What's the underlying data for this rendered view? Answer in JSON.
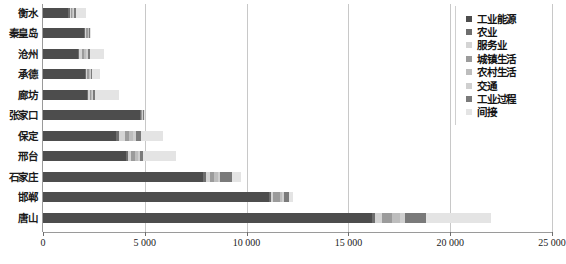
{
  "chart_data": {
    "type": "bar",
    "orientation": "horizontal",
    "stacked": true,
    "title": "",
    "subtitle": "",
    "xlabel": "",
    "ylabel": "",
    "xlim": [
      0,
      25000
    ],
    "ylim": null,
    "grid": true,
    "grid_axis": "x",
    "legend_position": "right",
    "xtick_labels": [
      "0",
      "5 000",
      "10 000",
      "15 000",
      "20 000",
      "25 000"
    ],
    "xtick_values": [
      0,
      5000,
      10000,
      15000,
      20000,
      25000
    ],
    "categories": [
      "衡水",
      "秦皇岛",
      "沧州",
      "承德",
      "廊坊",
      "张家口",
      "保定",
      "邢台",
      "石家庄",
      "邯郸",
      "唐山"
    ],
    "series": [
      {
        "name": "工业能源",
        "color": "#4d4d4d",
        "values": [
          1250,
          2030,
          1720,
          2080,
          2180,
          4760,
          3580,
          4100,
          7860,
          11100,
          16150
        ]
      },
      {
        "name": "农业",
        "color": "#6e6e6e",
        "values": [
          60,
          45,
          60,
          40,
          55,
          40,
          160,
          95,
          130,
          80,
          180
        ]
      },
      {
        "name": "服务业",
        "color": "#d4d4d4",
        "values": [
          70,
          40,
          140,
          35,
          55,
          20,
          280,
          150,
          200,
          120,
          300
        ]
      },
      {
        "name": "城镇生活",
        "color": "#9b9b9b",
        "values": [
          55,
          95,
          85,
          110,
          75,
          45,
          220,
          170,
          230,
          330,
          520
        ]
      },
      {
        "name": "农村生活",
        "color": "#bdbdbd",
        "values": [
          55,
          30,
          110,
          45,
          60,
          20,
          190,
          130,
          160,
          120,
          380
        ]
      },
      {
        "name": "交通",
        "color": "#cfcfcf",
        "values": [
          50,
          30,
          95,
          40,
          50,
          25,
          150,
          110,
          140,
          100,
          260
        ]
      },
      {
        "name": "工业过程",
        "color": "#7a7a7a",
        "values": [
          70,
          45,
          120,
          55,
          70,
          30,
          230,
          180,
          560,
          240,
          1030
        ]
      },
      {
        "name": "间接",
        "color": "#e4e4e4",
        "values": [
          500,
          45,
          690,
          375,
          1180,
          15,
          1090,
          1580,
          430,
          210,
          3210
        ]
      }
    ]
  },
  "legend": {
    "items": [
      {
        "label": "工业能源",
        "color": "#4d4d4d"
      },
      {
        "label": "农业",
        "color": "#6e6e6e"
      },
      {
        "label": "服务业",
        "color": "#d4d4d4"
      },
      {
        "label": "城镇生活",
        "color": "#9b9b9b"
      },
      {
        "label": "农村生活",
        "color": "#bdbdbd"
      },
      {
        "label": "交通",
        "color": "#cfcfcf"
      },
      {
        "label": "工业过程",
        "color": "#7a7a7a"
      },
      {
        "label": "间接",
        "color": "#e4e4e4"
      }
    ]
  }
}
